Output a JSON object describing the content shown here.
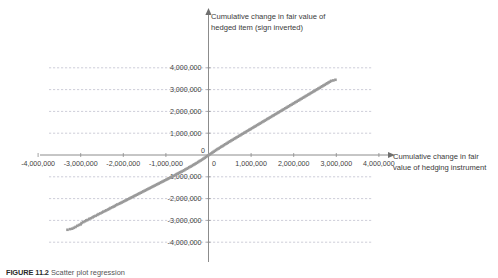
{
  "figure": {
    "caption_number": "FIGURE 11.2",
    "caption_text": "Scatter plot regression"
  },
  "chart_data": {
    "type": "scatter",
    "title": "",
    "xlabel": "Cumulative change in fair value of hedging instrument",
    "ylabel": "Cumulative change in fair value of hedged item (sign inverted)",
    "xlim": [
      -4600000,
      4600000
    ],
    "ylim": [
      -4600000,
      4600000
    ],
    "grid": "horizontal-dashed",
    "legend": "none",
    "marker_color": "#9a9a9a",
    "axis_color": "#8c8c8c",
    "grid_color": "#b9b9c8",
    "x_ticks": [
      "-4,000,000",
      "-3,000,000",
      "-2,000,000",
      "-1,000,000",
      "1,000,000",
      "2,000,000",
      "3,000,000",
      "4,000,000"
    ],
    "x_tick_values": [
      -4000000,
      -3000000,
      -2000000,
      -1000000,
      1000000,
      2000000,
      3000000,
      4000000
    ],
    "y_ticks": [
      "4,000,000",
      "3,000,000",
      "2,000,000",
      "1,000,000",
      "-1,000,000",
      "-2,000,000",
      "-3,000,000",
      "-4,000,000"
    ],
    "y_tick_values": [
      4000000,
      3000000,
      2000000,
      1000000,
      -1000000,
      -2000000,
      -3000000,
      -4000000
    ],
    "origin_label_x": "0",
    "origin_label_y": "0",
    "points": [
      [
        -3310000,
        -3430000
      ],
      [
        -3250000,
        -3400000
      ],
      [
        -3200000,
        -3380000
      ],
      [
        -3160000,
        -3340000
      ],
      [
        -3120000,
        -3300000
      ],
      [
        -3080000,
        -3250000
      ],
      [
        -3040000,
        -3210000
      ],
      [
        -3000000,
        -3180000
      ],
      [
        -2980000,
        -3120000
      ],
      [
        -2940000,
        -3080000
      ],
      [
        -2900000,
        -3040000
      ],
      [
        -2870000,
        -3000000
      ],
      [
        -2840000,
        -2980000
      ],
      [
        -2800000,
        -2930000
      ],
      [
        -2760000,
        -2900000
      ],
      [
        -2720000,
        -2860000
      ],
      [
        -2690000,
        -2820000
      ],
      [
        -2650000,
        -2790000
      ],
      [
        -2610000,
        -2750000
      ],
      [
        -2580000,
        -2710000
      ],
      [
        -2540000,
        -2680000
      ],
      [
        -2500000,
        -2640000
      ],
      [
        -2470000,
        -2600000
      ],
      [
        -2430000,
        -2570000
      ],
      [
        -2400000,
        -2540000
      ],
      [
        -2360000,
        -2500000
      ],
      [
        -2330000,
        -2470000
      ],
      [
        -2300000,
        -2430000
      ],
      [
        -2260000,
        -2400000
      ],
      [
        -2230000,
        -2370000
      ],
      [
        -2200000,
        -2340000
      ],
      [
        -2170000,
        -2300000
      ],
      [
        -2140000,
        -2270000
      ],
      [
        -2100000,
        -2240000
      ],
      [
        -2070000,
        -2210000
      ],
      [
        -2040000,
        -2180000
      ],
      [
        -2010000,
        -2150000
      ],
      [
        -1980000,
        -2120000
      ],
      [
        -1950000,
        -2090000
      ],
      [
        -1920000,
        -2060000
      ],
      [
        -1890000,
        -2030000
      ],
      [
        -1860000,
        -2000000
      ],
      [
        -1830000,
        -1970000
      ],
      [
        -1800000,
        -1940000
      ],
      [
        -1770000,
        -1910000
      ],
      [
        -1740000,
        -1880000
      ],
      [
        -1710000,
        -1850000
      ],
      [
        -1680000,
        -1820000
      ],
      [
        -1650000,
        -1790000
      ],
      [
        -1620000,
        -1760000
      ],
      [
        -1590000,
        -1730000
      ],
      [
        -1560000,
        -1700000
      ],
      [
        -1530000,
        -1670000
      ],
      [
        -1500000,
        -1640000
      ],
      [
        -1470000,
        -1610000
      ],
      [
        -1440000,
        -1580000
      ],
      [
        -1410000,
        -1550000
      ],
      [
        -1380000,
        -1520000
      ],
      [
        -1350000,
        -1490000
      ],
      [
        -1320000,
        -1460000
      ],
      [
        -1290000,
        -1430000
      ],
      [
        -1260000,
        -1400000
      ],
      [
        -1230000,
        -1370000
      ],
      [
        -1200000,
        -1340000
      ],
      [
        -1170000,
        -1310000
      ],
      [
        -1140000,
        -1280000
      ],
      [
        -1110000,
        -1250000
      ],
      [
        -1080000,
        -1220000
      ],
      [
        -1050000,
        -1190000
      ],
      [
        -1020000,
        -1160000
      ],
      [
        -990000,
        -1130000
      ],
      [
        -960000,
        -1100000
      ],
      [
        -930000,
        -1070000
      ],
      [
        -900000,
        -1040000
      ],
      [
        -870000,
        -1010000
      ],
      [
        -840000,
        -980000
      ],
      [
        -810000,
        -950000
      ],
      [
        -780000,
        -920000
      ],
      [
        -750000,
        -880000
      ],
      [
        -720000,
        -850000
      ],
      [
        -690000,
        -820000
      ],
      [
        -660000,
        -790000
      ],
      [
        -630000,
        -760000
      ],
      [
        -600000,
        -730000
      ],
      [
        -570000,
        -700000
      ],
      [
        -540000,
        -660000
      ],
      [
        -510000,
        -630000
      ],
      [
        -480000,
        -600000
      ],
      [
        -450000,
        -560000
      ],
      [
        -420000,
        -530000
      ],
      [
        -390000,
        -500000
      ],
      [
        -360000,
        -460000
      ],
      [
        -330000,
        -430000
      ],
      [
        -300000,
        -390000
      ],
      [
        -270000,
        -360000
      ],
      [
        -240000,
        -320000
      ],
      [
        -210000,
        -280000
      ],
      [
        -180000,
        -250000
      ],
      [
        -150000,
        -210000
      ],
      [
        -120000,
        -170000
      ],
      [
        -90000,
        -130000
      ],
      [
        -60000,
        -90000
      ],
      [
        -30000,
        -50000
      ],
      [
        0,
        -10000
      ],
      [
        30000,
        30000
      ],
      [
        60000,
        70000
      ],
      [
        90000,
        110000
      ],
      [
        120000,
        150000
      ],
      [
        150000,
        190000
      ],
      [
        180000,
        230000
      ],
      [
        210000,
        270000
      ],
      [
        240000,
        300000
      ],
      [
        270000,
        340000
      ],
      [
        300000,
        380000
      ],
      [
        330000,
        410000
      ],
      [
        360000,
        450000
      ],
      [
        390000,
        490000
      ],
      [
        420000,
        520000
      ],
      [
        450000,
        560000
      ],
      [
        480000,
        600000
      ],
      [
        510000,
        630000
      ],
      [
        540000,
        670000
      ],
      [
        570000,
        700000
      ],
      [
        600000,
        740000
      ],
      [
        630000,
        770000
      ],
      [
        660000,
        810000
      ],
      [
        690000,
        840000
      ],
      [
        720000,
        880000
      ],
      [
        750000,
        910000
      ],
      [
        780000,
        950000
      ],
      [
        810000,
        980000
      ],
      [
        840000,
        1020000
      ],
      [
        870000,
        1050000
      ],
      [
        900000,
        1090000
      ],
      [
        930000,
        1120000
      ],
      [
        960000,
        1160000
      ],
      [
        990000,
        1190000
      ],
      [
        1020000,
        1230000
      ],
      [
        1050000,
        1260000
      ],
      [
        1080000,
        1300000
      ],
      [
        1110000,
        1330000
      ],
      [
        1140000,
        1370000
      ],
      [
        1170000,
        1400000
      ],
      [
        1200000,
        1440000
      ],
      [
        1230000,
        1470000
      ],
      [
        1260000,
        1510000
      ],
      [
        1290000,
        1540000
      ],
      [
        1320000,
        1580000
      ],
      [
        1350000,
        1610000
      ],
      [
        1380000,
        1650000
      ],
      [
        1410000,
        1680000
      ],
      [
        1440000,
        1720000
      ],
      [
        1470000,
        1750000
      ],
      [
        1500000,
        1790000
      ],
      [
        1530000,
        1820000
      ],
      [
        1560000,
        1860000
      ],
      [
        1590000,
        1890000
      ],
      [
        1620000,
        1930000
      ],
      [
        1650000,
        1960000
      ],
      [
        1680000,
        2000000
      ],
      [
        1710000,
        2030000
      ],
      [
        1740000,
        2070000
      ],
      [
        1770000,
        2100000
      ],
      [
        1800000,
        2140000
      ],
      [
        1830000,
        2170000
      ],
      [
        1860000,
        2210000
      ],
      [
        1890000,
        2240000
      ],
      [
        1920000,
        2280000
      ],
      [
        1950000,
        2310000
      ],
      [
        1980000,
        2350000
      ],
      [
        2010000,
        2380000
      ],
      [
        2040000,
        2420000
      ],
      [
        2070000,
        2450000
      ],
      [
        2100000,
        2490000
      ],
      [
        2130000,
        2520000
      ],
      [
        2160000,
        2560000
      ],
      [
        2190000,
        2590000
      ],
      [
        2220000,
        2630000
      ],
      [
        2250000,
        2660000
      ],
      [
        2280000,
        2700000
      ],
      [
        2310000,
        2730000
      ],
      [
        2340000,
        2770000
      ],
      [
        2370000,
        2800000
      ],
      [
        2400000,
        2840000
      ],
      [
        2430000,
        2870000
      ],
      [
        2460000,
        2910000
      ],
      [
        2490000,
        2940000
      ],
      [
        2520000,
        2980000
      ],
      [
        2550000,
        3010000
      ],
      [
        2580000,
        3050000
      ],
      [
        2610000,
        3080000
      ],
      [
        2640000,
        3120000
      ],
      [
        2670000,
        3150000
      ],
      [
        2700000,
        3190000
      ],
      [
        2730000,
        3220000
      ],
      [
        2760000,
        3260000
      ],
      [
        2790000,
        3290000
      ],
      [
        2820000,
        3330000
      ],
      [
        2850000,
        3360000
      ],
      [
        2880000,
        3400000
      ],
      [
        2930000,
        3420000
      ],
      [
        2980000,
        3450000
      ]
    ]
  }
}
